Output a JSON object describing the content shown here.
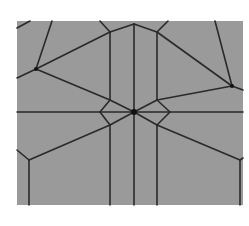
{
  "diagram": {
    "kind": "crease-pattern / voronoi line diagram",
    "colors": {
      "background": "#ffffff",
      "panel": "#9a9a9a",
      "edge": "#2a2a2a",
      "node": "#111111"
    },
    "panel": {
      "x": 17,
      "y": 21,
      "width": 226,
      "height": 184
    },
    "nodes": [
      {
        "id": "center",
        "x": 134,
        "y": 112,
        "r": 3
      },
      {
        "id": "left",
        "x": 36,
        "y": 69,
        "r": 2
      },
      {
        "id": "right",
        "x": 232,
        "y": 86,
        "r": 2
      }
    ],
    "edges": [
      [
        17,
        112,
        243,
        112
      ],
      [
        134,
        24,
        134,
        205
      ],
      [
        110,
        32,
        110,
        100
      ],
      [
        157,
        32,
        157,
        100
      ],
      [
        110,
        125,
        110,
        205
      ],
      [
        157,
        125,
        157,
        205
      ],
      [
        29,
        160,
        29,
        205
      ],
      [
        240,
        160,
        240,
        205
      ],
      [
        100,
        112,
        110,
        100
      ],
      [
        110,
        100,
        134,
        112
      ],
      [
        134,
        112,
        157,
        100
      ],
      [
        157,
        100,
        170,
        112
      ],
      [
        100,
        112,
        110,
        125
      ],
      [
        110,
        125,
        134,
        112
      ],
      [
        134,
        112,
        157,
        125
      ],
      [
        157,
        125,
        170,
        112
      ],
      [
        36,
        69,
        17,
        78
      ],
      [
        36,
        69,
        52,
        21
      ],
      [
        36,
        69,
        110,
        32
      ],
      [
        110,
        32,
        134,
        24
      ],
      [
        134,
        24,
        157,
        32
      ],
      [
        157,
        32,
        232,
        86
      ],
      [
        232,
        86,
        215,
        21
      ],
      [
        232,
        86,
        243,
        90
      ],
      [
        36,
        69,
        110,
        100
      ],
      [
        232,
        86,
        157,
        100
      ],
      [
        110,
        125,
        29,
        160
      ],
      [
        29,
        160,
        17,
        150
      ],
      [
        157,
        125,
        240,
        160
      ],
      [
        240,
        160,
        243,
        158
      ],
      [
        17,
        28,
        30,
        21
      ],
      [
        100,
        21,
        110,
        32
      ],
      [
        157,
        32,
        168,
        21
      ]
    ]
  }
}
